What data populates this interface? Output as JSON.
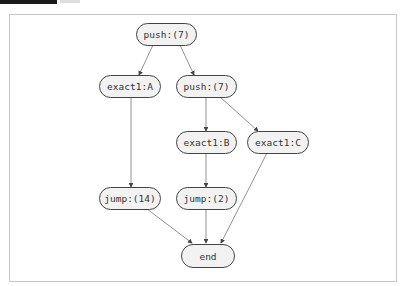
{
  "diagram": {
    "type": "flow-graph",
    "nodes": [
      {
        "id": "n1",
        "label": "push:(7)"
      },
      {
        "id": "n2",
        "label": "exact1:A"
      },
      {
        "id": "n3",
        "label": "push:(7)"
      },
      {
        "id": "n4",
        "label": "exact1:B"
      },
      {
        "id": "n5",
        "label": "exact1:C"
      },
      {
        "id": "n6",
        "label": "jump:(14)"
      },
      {
        "id": "n7",
        "label": "jump:(2)"
      },
      {
        "id": "n8",
        "label": "end"
      }
    ],
    "edges": [
      {
        "from": "n1",
        "to": "n2"
      },
      {
        "from": "n1",
        "to": "n3"
      },
      {
        "from": "n2",
        "to": "n6"
      },
      {
        "from": "n3",
        "to": "n4"
      },
      {
        "from": "n3",
        "to": "n5"
      },
      {
        "from": "n4",
        "to": "n7"
      },
      {
        "from": "n6",
        "to": "n8"
      },
      {
        "from": "n7",
        "to": "n8"
      },
      {
        "from": "n5",
        "to": "n8"
      }
    ]
  }
}
